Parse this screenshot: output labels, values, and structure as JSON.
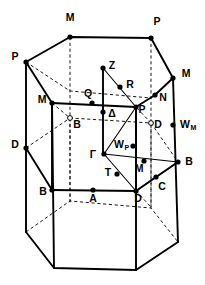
{
  "figure": {
    "stroke_color": "#000000",
    "background_color": "#ffffff"
  },
  "labels": [
    {
      "id": "M-top",
      "text": "M",
      "sub": "",
      "x": 70,
      "y": 21,
      "anchor": "middle"
    },
    {
      "id": "P-topright",
      "text": "P",
      "sub": "",
      "x": 157,
      "y": 25,
      "anchor": "middle"
    },
    {
      "id": "P-left",
      "text": "P",
      "sub": "",
      "x": 15,
      "y": 60,
      "anchor": "middle"
    },
    {
      "id": "M-right",
      "text": "M",
      "sub": "",
      "x": 186,
      "y": 77,
      "anchor": "middle"
    },
    {
      "id": "Z",
      "text": "Z",
      "sub": "",
      "x": 112,
      "y": 69,
      "anchor": "middle"
    },
    {
      "id": "R",
      "text": "R",
      "sub": "",
      "x": 130,
      "y": 88,
      "anchor": "middle"
    },
    {
      "id": "Q",
      "text": "Q",
      "sub": "",
      "x": 88,
      "y": 97,
      "anchor": "middle"
    },
    {
      "id": "N",
      "text": "N",
      "sub": "",
      "x": 163,
      "y": 101,
      "anchor": "middle"
    },
    {
      "id": "M-innerleft",
      "text": "M",
      "sub": "",
      "x": 42,
      "y": 103,
      "anchor": "middle"
    },
    {
      "id": "P-inner",
      "text": "P",
      "sub": "",
      "x": 142,
      "y": 113,
      "anchor": "middle"
    },
    {
      "id": "Delta",
      "text": "Δ",
      "sub": "",
      "x": 112,
      "y": 117,
      "anchor": "middle"
    },
    {
      "id": "B-hidden",
      "text": "B",
      "sub": "",
      "x": 77,
      "y": 128,
      "anchor": "middle"
    },
    {
      "id": "D-hidden",
      "text": "D",
      "sub": "",
      "x": 158,
      "y": 128,
      "anchor": "middle"
    },
    {
      "id": "WM",
      "text": "W",
      "sub": "M",
      "x": 180,
      "y": 128,
      "anchor": "start"
    },
    {
      "id": "D-left",
      "text": "D",
      "sub": "",
      "x": 15,
      "y": 148,
      "anchor": "middle"
    },
    {
      "id": "WP",
      "text": "W",
      "sub": "P",
      "x": 114,
      "y": 148,
      "anchor": "start"
    },
    {
      "id": "Gamma",
      "text": "Γ",
      "sub": "",
      "x": 93,
      "y": 158,
      "anchor": "middle"
    },
    {
      "id": "B-right",
      "text": "B",
      "sub": "",
      "x": 189,
      "y": 165,
      "anchor": "middle"
    },
    {
      "id": "M-lower",
      "text": "M",
      "sub": "",
      "x": 139,
      "y": 172,
      "anchor": "middle"
    },
    {
      "id": "T",
      "text": "T",
      "sub": "",
      "x": 108,
      "y": 176,
      "anchor": "middle"
    },
    {
      "id": "C",
      "text": "C",
      "sub": "",
      "x": 162,
      "y": 190,
      "anchor": "middle"
    },
    {
      "id": "B-left",
      "text": "B",
      "sub": "",
      "x": 43,
      "y": 195,
      "anchor": "middle"
    },
    {
      "id": "A",
      "text": "A",
      "sub": "",
      "x": 93,
      "y": 202,
      "anchor": "middle"
    },
    {
      "id": "D-lower",
      "text": "D",
      "sub": "",
      "x": 138,
      "y": 202,
      "anchor": "middle"
    }
  ],
  "points": [
    {
      "id": "M-top",
      "x": 70,
      "y": 37,
      "style": "filled"
    },
    {
      "id": "P-topright",
      "x": 151,
      "y": 38,
      "style": "filled"
    },
    {
      "id": "P-left",
      "x": 26,
      "y": 62,
      "style": "filled"
    },
    {
      "id": "M-right",
      "x": 173,
      "y": 78,
      "style": "filled"
    },
    {
      "id": "Z",
      "x": 103,
      "y": 68,
      "style": "filled"
    },
    {
      "id": "R",
      "x": 120,
      "y": 87,
      "style": "filled"
    },
    {
      "id": "Q",
      "x": 92,
      "y": 103,
      "style": "filled"
    },
    {
      "id": "N",
      "x": 155,
      "y": 95,
      "style": "filled"
    },
    {
      "id": "M-innerleft",
      "x": 52,
      "y": 103,
      "style": "filled"
    },
    {
      "id": "P-inner",
      "x": 136,
      "y": 107,
      "style": "filled"
    },
    {
      "id": "Delta",
      "x": 103,
      "y": 112,
      "style": "filled"
    },
    {
      "id": "B-hidden",
      "x": 70,
      "y": 118,
      "style": "open"
    },
    {
      "id": "D-hidden",
      "x": 151,
      "y": 123,
      "style": "open"
    },
    {
      "id": "WM",
      "x": 173,
      "y": 125,
      "style": "filled"
    },
    {
      "id": "D-left",
      "x": 26,
      "y": 148,
      "style": "filled"
    },
    {
      "id": "WP",
      "x": 133,
      "y": 146,
      "style": "filled"
    },
    {
      "id": "Gamma",
      "x": 104,
      "y": 154,
      "style": "filled"
    },
    {
      "id": "B-right",
      "x": 178,
      "y": 162,
      "style": "filled"
    },
    {
      "id": "M-lower",
      "x": 144,
      "y": 161,
      "style": "filled"
    },
    {
      "id": "T",
      "x": 117,
      "y": 174,
      "style": "filled"
    },
    {
      "id": "C",
      "x": 156,
      "y": 177,
      "style": "filled"
    },
    {
      "id": "B-left",
      "x": 52,
      "y": 190,
      "style": "filled"
    },
    {
      "id": "A",
      "x": 93,
      "y": 190,
      "style": "filled"
    },
    {
      "id": "D-lower",
      "x": 136,
      "y": 191,
      "style": "filled"
    }
  ],
  "geometry": {
    "outer_top_hexagon": "26,62 70,37 151,38 173,78 151,98 70,91",
    "outer_bottom_hexagon": "26,232 54,268 136,270 178,242 151,208 70,201",
    "outer_vertical_left": "26,62 26,232",
    "outer_vertical_midleft": "70,37 70,201",
    "outer_vertical_midright": "151,38 151,208",
    "outer_vertical_right": "173,78 178,242",
    "inner_top_hexagon": "52,103 70,118 136,107 151,123",
    "inner_bottom_hexagon": "52,190 70,205 136,191 151,207",
    "inner_vertical_left": "52,103 52,190",
    "inner_vertical_right": "136,107 136,191",
    "axis_vertical": "103,68 103,154"
  }
}
